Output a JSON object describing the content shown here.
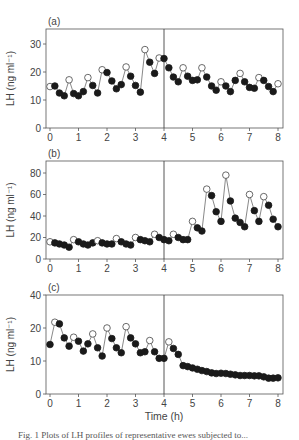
{
  "chart_data": [
    {
      "type": "line",
      "panel_label": "(a)",
      "xlabel": "",
      "ylabel": "LH (ng ml⁻¹)",
      "xlim": [
        0,
        8
      ],
      "ylim": [
        0,
        35
      ],
      "xticks": [
        0,
        1,
        2,
        3,
        4,
        5,
        6,
        7,
        8
      ],
      "yticks": [
        0,
        10,
        20,
        30
      ],
      "vline_x": 4,
      "grid": false,
      "series": [
        {
          "name": "LH",
          "x": [
            0.0,
            0.17,
            0.33,
            0.5,
            0.67,
            0.83,
            1.0,
            1.17,
            1.33,
            1.5,
            1.67,
            1.83,
            2.0,
            2.17,
            2.33,
            2.5,
            2.67,
            2.83,
            3.0,
            3.17,
            3.33,
            3.5,
            3.67,
            3.83,
            4.0,
            4.17,
            4.33,
            4.5,
            4.67,
            4.83,
            5.0,
            5.17,
            5.33,
            5.5,
            5.67,
            5.83,
            6.0,
            6.17,
            6.33,
            6.5,
            6.67,
            6.83,
            7.0,
            7.17,
            7.33,
            7.5,
            7.67,
            7.83,
            8.0
          ],
          "y": [
            14.8,
            15.0,
            12.5,
            11.5,
            17.2,
            12.3,
            11.5,
            13.0,
            18.0,
            15.2,
            12.5,
            20.8,
            19.8,
            16.8,
            14.0,
            15.5,
            21.8,
            18.5,
            15.2,
            12.8,
            28.0,
            23.5,
            19.5,
            25.0,
            24.8,
            21.5,
            18.2,
            16.5,
            21.5,
            18.5,
            17.0,
            17.2,
            21.5,
            18.2,
            15.0,
            13.5,
            16.5,
            15.0,
            13.0,
            17.0,
            19.5,
            16.5,
            14.5,
            14.2,
            18.0,
            17.0,
            14.8,
            13.0,
            15.8
          ],
          "open": [
            true,
            false,
            false,
            false,
            true,
            false,
            false,
            false,
            true,
            false,
            false,
            true,
            false,
            false,
            false,
            false,
            true,
            false,
            false,
            false,
            true,
            false,
            false,
            true,
            false,
            false,
            false,
            false,
            true,
            false,
            false,
            false,
            true,
            false,
            false,
            false,
            true,
            false,
            false,
            false,
            true,
            false,
            false,
            false,
            true,
            false,
            false,
            false,
            true
          ]
        }
      ]
    },
    {
      "type": "line",
      "panel_label": "(b)",
      "xlabel": "",
      "ylabel": "LH (ng ml⁻¹)",
      "xlim": [
        0,
        8
      ],
      "ylim": [
        0,
        90
      ],
      "xticks": [
        0,
        1,
        2,
        3,
        4,
        5,
        6,
        7,
        8
      ],
      "yticks": [
        0,
        20,
        40,
        60,
        80
      ],
      "vline_x": 4,
      "grid": false,
      "series": [
        {
          "name": "LH",
          "x": [
            0.0,
            0.17,
            0.33,
            0.5,
            0.67,
            0.83,
            1.0,
            1.17,
            1.33,
            1.5,
            1.67,
            1.83,
            2.0,
            2.17,
            2.33,
            2.5,
            2.67,
            2.83,
            3.0,
            3.17,
            3.33,
            3.5,
            3.67,
            3.83,
            4.0,
            4.17,
            4.33,
            4.5,
            4.67,
            4.83,
            5.0,
            5.17,
            5.33,
            5.5,
            5.67,
            5.83,
            6.0,
            6.17,
            6.33,
            6.5,
            6.67,
            6.83,
            7.0,
            7.17,
            7.33,
            7.5,
            7.67,
            7.83,
            8.0
          ],
          "y": [
            16,
            15,
            14,
            13,
            11,
            18,
            16,
            14,
            13,
            15,
            17,
            15,
            14,
            14,
            19,
            16,
            14,
            13,
            20,
            18,
            17,
            16,
            23,
            20,
            18,
            17,
            23,
            20,
            18,
            18,
            35,
            29,
            26,
            65,
            59,
            44,
            35,
            78,
            54,
            38,
            34,
            30,
            60,
            45,
            35,
            58,
            50,
            37,
            30
          ],
          "open": [
            true,
            false,
            false,
            false,
            false,
            true,
            false,
            false,
            false,
            false,
            true,
            false,
            false,
            false,
            true,
            false,
            false,
            false,
            true,
            false,
            false,
            false,
            true,
            false,
            false,
            false,
            true,
            false,
            false,
            false,
            true,
            false,
            false,
            true,
            false,
            false,
            false,
            true,
            false,
            false,
            false,
            false,
            true,
            false,
            false,
            true,
            false,
            false,
            false
          ]
        }
      ]
    },
    {
      "type": "line",
      "panel_label": "(c)",
      "xlabel": "Time (h)",
      "ylabel": "LH (ng ml⁻¹)",
      "xlim": [
        0,
        8
      ],
      "ylim": [
        0,
        40
      ],
      "xticks": [
        0,
        1,
        2,
        3,
        4,
        5,
        6,
        7,
        8
      ],
      "yticks": [
        0,
        10,
        20,
        40
      ],
      "vline_x": 4,
      "grid": false,
      "series": [
        {
          "name": "LH",
          "x": [
            0.0,
            0.17,
            0.33,
            0.5,
            0.67,
            0.83,
            1.0,
            1.17,
            1.33,
            1.5,
            1.67,
            1.83,
            2.0,
            2.17,
            2.33,
            2.5,
            2.67,
            2.83,
            3.0,
            3.17,
            3.33,
            3.5,
            3.67,
            3.83,
            4.0,
            4.17,
            4.33,
            4.5,
            4.67,
            4.83,
            5.0,
            5.17,
            5.33,
            5.5,
            5.67,
            5.83,
            6.0,
            6.17,
            6.33,
            6.5,
            6.67,
            6.83,
            7.0,
            7.17,
            7.33,
            7.5,
            7.67,
            7.83,
            8.0
          ],
          "y": [
            15,
            23.5,
            22.5,
            17,
            14.5,
            17.2,
            16,
            13,
            15.2,
            18.2,
            14,
            11.5,
            20,
            16.8,
            14,
            12.5,
            20.8,
            17,
            15.2,
            12.5,
            12.8,
            16.2,
            12.8,
            10.8,
            10.8,
            15.8,
            13.8,
            12.0,
            8.6,
            8.3,
            7.9,
            7.5,
            7.1,
            6.8,
            6.4,
            6.2,
            6.3,
            6.2,
            6.0,
            5.8,
            5.6,
            5.6,
            5.6,
            5.5,
            5.5,
            5.2,
            4.8,
            4.8,
            4.9
          ],
          "open": [
            false,
            true,
            false,
            false,
            false,
            true,
            false,
            false,
            false,
            true,
            false,
            false,
            true,
            false,
            false,
            false,
            true,
            false,
            false,
            false,
            false,
            true,
            false,
            false,
            false,
            true,
            false,
            false,
            false,
            false,
            false,
            false,
            false,
            false,
            false,
            false,
            false,
            false,
            false,
            false,
            false,
            false,
            false,
            false,
            false,
            false,
            false,
            false,
            false
          ]
        }
      ]
    }
  ],
  "figure": {
    "panels": [
      {
        "label": "(a)",
        "ylabel": "LH (ng ml⁻¹)",
        "xticks": [
          "0",
          "1",
          "2",
          "3",
          "4",
          "5",
          "6",
          "7",
          "8"
        ],
        "yticks": [
          "0",
          "10",
          "20",
          "30"
        ]
      },
      {
        "label": "(b)",
        "ylabel": "LH (ng ml⁻¹)",
        "xticks": [
          "0",
          "1",
          "2",
          "3",
          "4",
          "5",
          "6",
          "7",
          "8"
        ],
        "yticks": [
          "0",
          "20",
          "40",
          "60",
          "80"
        ]
      },
      {
        "label": "(c)",
        "ylabel": "LH (ng ml⁻¹)",
        "xticks": [
          "0",
          "1",
          "2",
          "3",
          "4",
          "5",
          "6",
          "7",
          "8"
        ],
        "yticks": [
          "0",
          "10",
          "20",
          "40"
        ]
      }
    ],
    "xlabel": "Time (h)",
    "caption": "Fig. 1  Plots of LH profiles of representative ewes subjected to..."
  }
}
